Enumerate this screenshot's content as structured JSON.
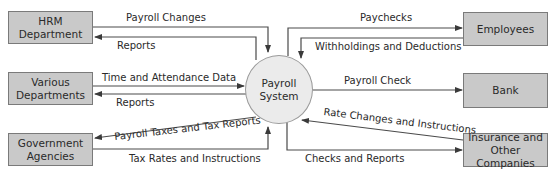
{
  "diagram": {
    "type": "context data flow diagram",
    "process": {
      "label": "Payroll\nSystem"
    },
    "entities": {
      "hrm": "HRM\nDepartment",
      "various": "Various\nDepartments",
      "government": "Government\nAgencies",
      "employees": "Employees",
      "bank": "Bank",
      "insurance": "Insurance and\nOther Companies"
    },
    "flows": {
      "payroll_changes": "Payroll Changes",
      "hrm_reports": "Reports",
      "time_attendance": "Time and Attendance Data",
      "dept_reports": "Reports",
      "payroll_taxes": "Payroll Taxes and Tax Reports",
      "tax_rates": "Tax Rates and Instructions",
      "paychecks": "Paychecks",
      "withholdings": "Withholdings and Deductions",
      "payroll_check": "Payroll Check",
      "rate_changes": "Rate Changes and Instructions",
      "checks_reports": "Checks and Reports"
    },
    "colors": {
      "entity_fill": "#c9c9c9",
      "entity_border": "#7a7a7a",
      "process_fill": "#ebebeb",
      "line": "#4a4a4a"
    }
  }
}
